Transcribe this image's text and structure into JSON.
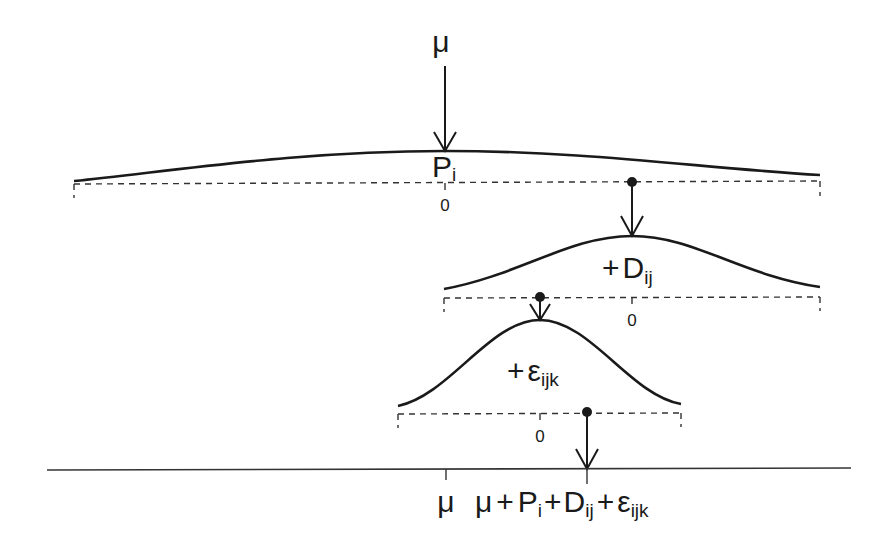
{
  "diagram": {
    "title_symbol": "μ",
    "levels": [
      {
        "name": "plant",
        "effect_label": "P",
        "effect_subscript": "i",
        "prefix": "",
        "zero_label": "0"
      },
      {
        "name": "day",
        "effect_label": "D",
        "effect_subscript": "ij",
        "prefix": "+",
        "zero_label": "0"
      },
      {
        "name": "residual",
        "effect_label": "ε",
        "effect_subscript": "ijk",
        "prefix": "+",
        "zero_label": "0"
      }
    ],
    "axis": {
      "mu_label": "μ",
      "sum": {
        "mu": "μ",
        "plus1": "+",
        "P": "P",
        "P_sub": "i",
        "plus2": "+",
        "D": "D",
        "D_sub": "ij",
        "plus3": "+",
        "E": "ε",
        "E_sub": "ijk"
      }
    },
    "colors": {
      "ink": "#1a1a1a",
      "background": "#ffffff"
    }
  }
}
